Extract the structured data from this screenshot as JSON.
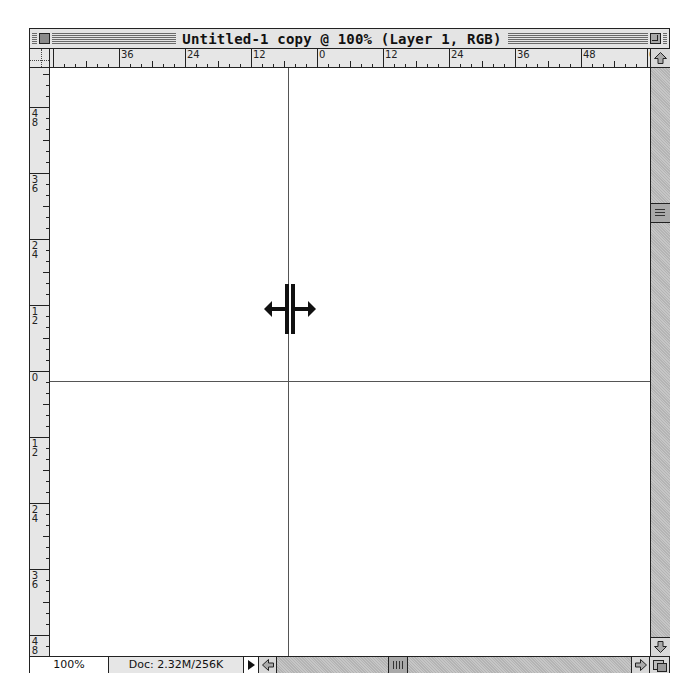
{
  "window": {
    "title": "Untitled-1 copy @ 100% (Layer 1, RGB)"
  },
  "rulers": {
    "unit_spacing_px": 66,
    "horizontal": {
      "labels": [
        "36",
        "24",
        "12",
        "0",
        "12",
        "24",
        "36",
        "48",
        "60"
      ],
      "positions": [
        69,
        135,
        201,
        267,
        333,
        399,
        465,
        531,
        597
      ]
    },
    "vertical": {
      "labels": [
        [
          "6",
          "0"
        ],
        [
          "4",
          "8"
        ],
        [
          "3",
          "6"
        ],
        [
          "2",
          "4"
        ],
        [
          "1",
          "2"
        ],
        [
          "0",
          ""
        ],
        [
          "1",
          "2"
        ],
        [
          "2",
          "4"
        ],
        [
          "3",
          "6"
        ],
        [
          "4",
          "8"
        ]
      ],
      "positions": [
        -27,
        39,
        105,
        171,
        237,
        303,
        369,
        435,
        501,
        567
      ]
    }
  },
  "guides": {
    "vertical_x": 238,
    "horizontal_y": 313
  },
  "cursor": {
    "type": "move-guide-horizontal",
    "x": 214,
    "y": 216
  },
  "status": {
    "zoom_level": "100%",
    "doc_info": "Doc: 2.32M/256K"
  },
  "scrollbars": {
    "vertical_thumb_top": 154,
    "horizontal_thumb_left": 129
  },
  "colors": {
    "chrome": "#e4e4e4",
    "scroll_track": "#bdbdbd",
    "guide": "#555555",
    "border": "#222222"
  }
}
